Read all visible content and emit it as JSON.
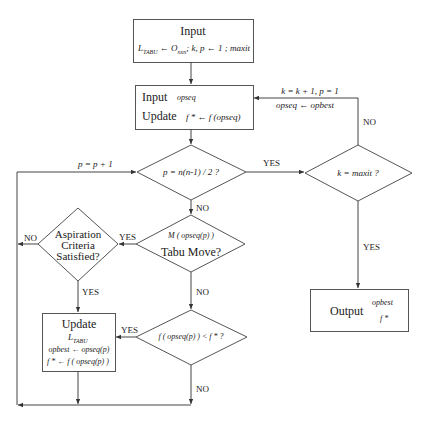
{
  "flowchart": {
    "input_box": {
      "title": "Input",
      "line_L": "L",
      "line_L_sub": "TABU",
      "line_arrow": "←",
      "line_O": "O",
      "line_O_sub": "nxn",
      "line_rest": "; k, p ← 1 ; maxit"
    },
    "init_box": {
      "input_label": "Input",
      "input_value": "opseq",
      "update_label": "Update",
      "update_value": "f * ← f (opseq)"
    },
    "loop_back": {
      "line1": "k = k + 1,  p = 1",
      "line2": "opseq ← opbest",
      "no_label": "NO"
    },
    "decision_p": {
      "text": "p = n(n-1) / 2 ?",
      "yes_label": "YES",
      "no_label": "NO",
      "increment_label": "p = p + 1"
    },
    "decision_k": {
      "text": "k = maxit ?",
      "yes_label": "YES"
    },
    "decision_tabu": {
      "line1": "M ( opseq(p) )",
      "line2": "Tabu Move?",
      "yes_label": "YES",
      "no_label": "NO"
    },
    "decision_aspiration": {
      "line1": "Aspiration",
      "line2": "Criteria",
      "line3": "Satisfied?",
      "yes_label": "YES",
      "no_label": "NO"
    },
    "decision_f": {
      "text": "f ( opseq(p) ) < f * ?",
      "yes_label": "YES",
      "no_label": "NO"
    },
    "update_box": {
      "title": "Update",
      "line1": "L",
      "line1_sub": "TABU",
      "line2": "opbest ← opseq(p)",
      "line3": "f * ← f ( opseq(p) )"
    },
    "output_box": {
      "title": "Output",
      "value1": "opbest",
      "value2": "f *"
    }
  }
}
